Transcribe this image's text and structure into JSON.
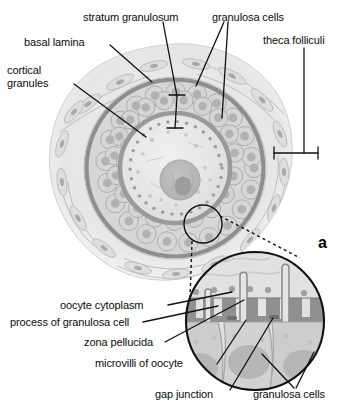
{
  "figure": {
    "panel_letter": "a",
    "background_color": "#ffffff",
    "ink_color": "#0b0b0b"
  },
  "labels": {
    "stratum_granulosum": "stratum granulosum",
    "granulosa_cells_top": "granulosa cells",
    "basal_lamina": "basal lamina",
    "theca_folliculi": "theca folliculi",
    "cortical_granules_line1": "cortical",
    "cortical_granules_line2": "granules",
    "oocyte_cytoplasm": "oocyte cytoplasm",
    "process_of_granulosa_cell": "process of granulosa cell",
    "zona_pellucida": "zona pellucida",
    "microvilli_of_oocyte": "microvilli of oocyte",
    "gap_junction": "gap junction",
    "granulosa_cells_bottom": "granulosa cells"
  },
  "palette": {
    "paper": "#ffffff",
    "theca_fill": "#e9e9e9",
    "theca_stroke": "#b8b8b8",
    "basal_lamina": "#8e8e8e",
    "granulosa_layer_fill": "#dcdcdc",
    "granulosa_cell_fill": "#d2d2d2",
    "granulosa_cell_stroke": "#a8a8a8",
    "granulosa_nucleus": "#b4b4b4",
    "zona_pellucida": "#9a9a9a",
    "ooplasm": "#e4e4e4",
    "oocyte_nucleus": "#b9b9b9",
    "oocyte_nucleolus": "#9d9d9d",
    "cortical_granule": "#9c9c9c",
    "inset_border": "#111111",
    "inset_ooplasm": "#dedede",
    "inset_zona": "#9b9b9b",
    "inset_process": "#8f8f8f",
    "inset_granulosa": "#c9c9c9",
    "inset_granulosa_nucleus": "#b0b0b0",
    "leader_line": "#111111"
  },
  "structures": {
    "main_view": {
      "name": "ovarian follicle cross-section",
      "center_x": 175,
      "center_y": 168,
      "outer_radius": 118,
      "basal_lamina_radius": 90,
      "zona_pellucida_radius": 56,
      "oocyte_radius": 52,
      "nucleus_radius": 20,
      "granulosa_cell_count": 68,
      "cortical_granule_count": 40
    },
    "detail_callout": {
      "name": "magnified region marker",
      "circle_x": 203,
      "circle_y": 224,
      "circle_radius": 19
    },
    "inset_view": {
      "name": "oocyte-granulosa cell interface detail",
      "center_x": 255,
      "center_y": 321,
      "radius": 69,
      "microvilli_count": 3,
      "granulosa_process_count": 3
    }
  }
}
